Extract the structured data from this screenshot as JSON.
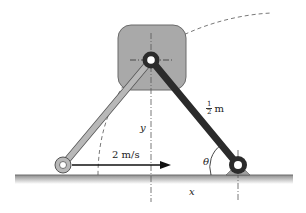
{
  "diagram": {
    "type": "mechanism",
    "colors": {
      "block_fill": "#a9a9a9",
      "block_stroke": "#555555",
      "dark_link": "#2b2b2b",
      "light_link": "#b5b5b5",
      "ground": "#9a9a9a",
      "dash": "#555555"
    },
    "labels": {
      "velocity": "2 m/s",
      "length_num": "1",
      "length_den": "2",
      "length_unit": "m",
      "y_label": "y",
      "x_label": "x",
      "theta_label": "θ"
    },
    "components": [
      {
        "name": "sliding-block",
        "desc": "rounded gray square block with pin at center"
      },
      {
        "name": "light-link",
        "desc": "light gray link from left roller pin to block pin"
      },
      {
        "name": "dark-link",
        "desc": "dark link of length 1/2 m from block pin to fixed pivot"
      },
      {
        "name": "left-pin",
        "desc": "pin at ground moving right at 2 m/s"
      },
      {
        "name": "fixed-pivot",
        "desc": "fixed pin support on ground"
      },
      {
        "name": "ground",
        "desc": "horizontal ground surface"
      },
      {
        "name": "dashed-arc",
        "desc": "path arc traced by block"
      }
    ]
  }
}
